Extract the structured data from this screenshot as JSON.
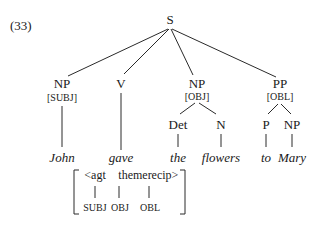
{
  "example_number": "(33)",
  "tree": {
    "root": "S",
    "nodes": {
      "np_subj": {
        "label": "NP",
        "feature": "[SUBJ]"
      },
      "v": {
        "label": "V"
      },
      "np_obj": {
        "label": "NP",
        "feature": "[OBJ]"
      },
      "pp_obl": {
        "label": "PP",
        "feature": "[OBL]"
      },
      "det": {
        "label": "Det"
      },
      "n": {
        "label": "N"
      },
      "p": {
        "label": "P"
      },
      "np_inner": {
        "label": "NP"
      }
    },
    "words": {
      "john": "John",
      "gave": "gave",
      "the": "the",
      "flowers": "flowers",
      "to": "to",
      "mary": "Mary"
    }
  },
  "argument_structure": {
    "roles": [
      "<agt",
      "theme",
      "recip>"
    ],
    "functions": [
      "SUBJ",
      "OBJ",
      "OBL"
    ]
  }
}
